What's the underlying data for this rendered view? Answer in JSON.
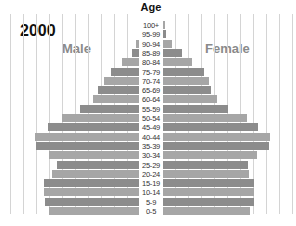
{
  "chart_data": {
    "type": "bar",
    "orientation": "horizontal-mirrored",
    "title": "2000",
    "ylabel": "Age",
    "xlabel": "",
    "categories": [
      "100+",
      "95-99",
      "90-94",
      "85-89",
      "80-84",
      "75-79",
      "70-74",
      "65-69",
      "60-64",
      "55-59",
      "50-54",
      "45-49",
      "40-44",
      "35-39",
      "30-34",
      "25-29",
      "20-24",
      "15-19",
      "10-14",
      "5-9",
      "0-5"
    ],
    "series": [
      {
        "name": "Male",
        "side": "left",
        "values": [
          0.1,
          0.1,
          0.3,
          0.6,
          1.4,
          2.2,
          2.8,
          3.2,
          3.6,
          4.6,
          6.0,
          7.1,
          8.1,
          8.0,
          7.0,
          6.4,
          6.8,
          7.4,
          7.4,
          7.3,
          7.0
        ]
      },
      {
        "name": "Female",
        "side": "right",
        "values": [
          0.2,
          0.3,
          0.8,
          1.5,
          2.3,
          3.2,
          3.6,
          3.8,
          4.2,
          5.1,
          6.5,
          7.4,
          8.3,
          8.2,
          7.3,
          6.6,
          6.7,
          7.1,
          7.1,
          7.1,
          6.8
        ]
      }
    ],
    "units": "gridline units (unlabeled)",
    "grid": true,
    "legend": "inline labels (Male left, Female right)"
  },
  "labels": {
    "year": "2000",
    "axis_title": "Age",
    "male": "Male",
    "female": "Female"
  },
  "colors": {
    "bar_dark": "#8c8c8c",
    "bar_light": "#a6a6a6",
    "grid": "#d4d4d4"
  }
}
